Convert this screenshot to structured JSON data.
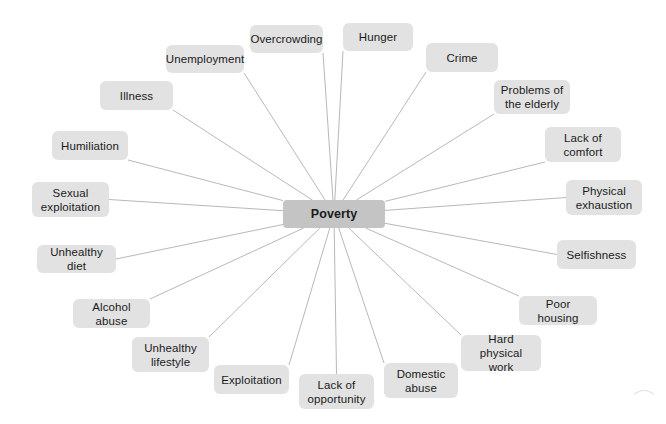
{
  "diagram": {
    "type": "mind-map",
    "background_color": "#ffffff",
    "node_color": "#e2e2e2",
    "center_node_color": "#c4c4c4",
    "edge_color": "#b8b8b8",
    "text_color": "#1b1b1b",
    "center": {
      "label": "Poverty",
      "x": 283,
      "y": 200,
      "w": 102,
      "h": 28
    },
    "nodes": [
      {
        "label": "Overcrowding",
        "x": 250,
        "y": 25,
        "w": 73,
        "h": 28
      },
      {
        "label": "Hunger",
        "x": 343,
        "y": 23,
        "w": 70,
        "h": 28
      },
      {
        "label": "Unemployment",
        "x": 166,
        "y": 45,
        "w": 78,
        "h": 28
      },
      {
        "label": "Crime",
        "x": 426,
        "y": 43,
        "w": 72,
        "h": 29
      },
      {
        "label": "Illness",
        "x": 100,
        "y": 81,
        "w": 73,
        "h": 29
      },
      {
        "label": "Problems of\nthe elderly",
        "x": 494,
        "y": 80,
        "w": 76,
        "h": 34
      },
      {
        "label": "Humiliation",
        "x": 52,
        "y": 131,
        "w": 76,
        "h": 29
      },
      {
        "label": "Lack of\ncomfort",
        "x": 545,
        "y": 127,
        "w": 76,
        "h": 35
      },
      {
        "label": "Sexual\nexploitation",
        "x": 32,
        "y": 182,
        "w": 77,
        "h": 35
      },
      {
        "label": "Physical\nexhaustion",
        "x": 566,
        "y": 180,
        "w": 76,
        "h": 35
      },
      {
        "label": "Unhealthy diet",
        "x": 37,
        "y": 245,
        "w": 79,
        "h": 28
      },
      {
        "label": "Selfishness",
        "x": 557,
        "y": 240,
        "w": 79,
        "h": 29
      },
      {
        "label": "Alcohol abuse",
        "x": 73,
        "y": 299,
        "w": 77,
        "h": 29
      },
      {
        "label": "Poor housing",
        "x": 519,
        "y": 296,
        "w": 78,
        "h": 29
      },
      {
        "label": "Unhealthy\nlifestyle",
        "x": 132,
        "y": 337,
        "w": 77,
        "h": 35
      },
      {
        "label": "Hard physical\nwork",
        "x": 461,
        "y": 335,
        "w": 80,
        "h": 36
      },
      {
        "label": "Exploitation",
        "x": 214,
        "y": 365,
        "w": 75,
        "h": 29
      },
      {
        "label": "Domestic\nabuse",
        "x": 384,
        "y": 363,
        "w": 74,
        "h": 35
      },
      {
        "label": "Lack of\nopportunity",
        "x": 299,
        "y": 374,
        "w": 75,
        "h": 35
      }
    ]
  }
}
